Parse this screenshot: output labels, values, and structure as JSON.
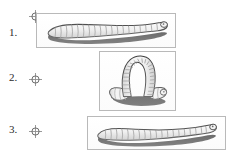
{
  "figure": {
    "background_color": "#ffffff",
    "panel_border_color": "#b9b9b9"
  },
  "colors": {
    "body_light": "#f2f2f2",
    "body_mid": "#d8d8d8",
    "body_outline": "#3a3a3a",
    "segment_line": "#8a8a8a",
    "shadow_dark": "#3d3d3d",
    "marker": "#6b6b6b",
    "numeral": "#2b2b2b"
  },
  "rows": [
    {
      "number": "1.",
      "marker": "crosshair-target-icon",
      "panel": {
        "name": "worm-extended-panel",
        "caption": "",
        "posture": "extended-stretched",
        "segment_count": 19
      }
    },
    {
      "number": "2.",
      "marker": "crosshair-target-icon",
      "panel": {
        "name": "worm-arched-panel",
        "caption": "",
        "posture": "arched-looped",
        "segment_count": 26
      }
    },
    {
      "number": "3.",
      "marker": "crosshair-target-icon",
      "panel": {
        "name": "worm-contracted-panel",
        "caption": "",
        "posture": "contracted-wavy",
        "segment_count": 21
      }
    }
  ]
}
